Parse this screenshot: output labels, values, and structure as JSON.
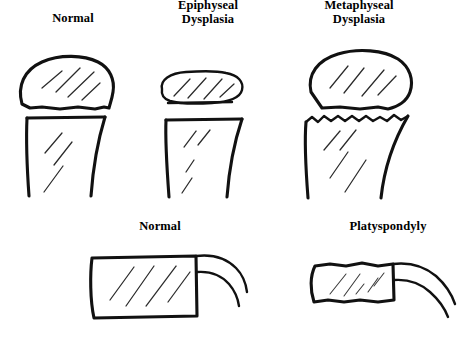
{
  "figure": {
    "title_present": false,
    "background_color": "#ffffff",
    "ink_color": "#111111",
    "rows": [
      {
        "row_name": "long-bone-row",
        "panels": [
          {
            "label": "Normal",
            "panel_name": "panel-normal-long-bone"
          },
          {
            "label": "Epiphyseal\nDysplasia",
            "panel_name": "panel-epiphyseal-dysplasia"
          },
          {
            "label": "Metaphyseal\nDysplasia",
            "panel_name": "panel-metaphyseal-dysplasia"
          }
        ]
      },
      {
        "row_name": "vertebra-row",
        "panels": [
          {
            "label": "Normal",
            "panel_name": "panel-normal-vertebra"
          },
          {
            "label": "Platyspondyly",
            "panel_name": "panel-platyspondyly"
          }
        ]
      }
    ]
  },
  "labels": {
    "top_normal": "Normal",
    "top_epiphyseal": "Epiphyseal\nDysplasia",
    "top_metaphyseal": "Metaphyseal\nDysplasia",
    "bottom_normal": "Normal",
    "bottom_platyspondyly": "Platyspondyly"
  }
}
